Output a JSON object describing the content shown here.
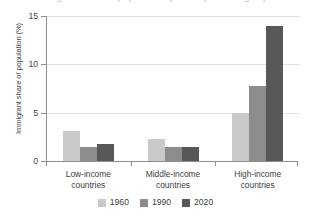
{
  "chart_data": {
    "type": "bar",
    "title": "Immigrant share of population by country income group",
    "xlabel": "",
    "ylabel": "Immigrant share of population (%)",
    "ylim": [
      0,
      15
    ],
    "yticks": [
      "0",
      "5",
      "10",
      "15"
    ],
    "ytick_values": [
      0,
      5,
      10,
      15
    ],
    "grid": true,
    "legend_position": "bottom",
    "categories": [
      "Low-income\ncountries",
      "Middle-income\ncountries",
      "High-income\ncountries"
    ],
    "category_lines": [
      [
        "Low-income",
        "countries"
      ],
      [
        "Middle-income",
        "countries"
      ],
      [
        "High-income",
        "countries"
      ]
    ],
    "series": [
      {
        "name": "1960",
        "color": "#c9c9c9",
        "values": [
          3.1,
          2.3,
          5.0
        ]
      },
      {
        "name": "1990",
        "color": "#8c8c8c",
        "values": [
          1.5,
          1.4,
          7.8
        ]
      },
      {
        "name": "2020",
        "color": "#585858",
        "values": [
          1.8,
          1.4,
          14.0
        ]
      }
    ]
  },
  "axis": {
    "axis_color": "#8e8e8e",
    "grid_color": "#e2e2e2"
  }
}
